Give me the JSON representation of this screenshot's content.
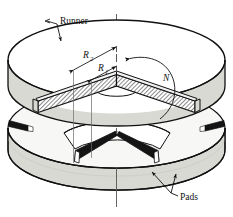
{
  "figure": {
    "type": "engineering-diagram",
    "labels": {
      "runner": "Runner",
      "pads": "Pads",
      "outer_radius": "R",
      "outer_radius_sub": "2",
      "inner_radius": "R",
      "inner_radius_sub": "1",
      "rotation": "N"
    },
    "colors": {
      "outline": "#111111",
      "rim_shade": "#d9d9d4",
      "top_face": "#ffffff",
      "pad_dark": "#1a1a1a",
      "hatch": "#333333",
      "background": "#ffffff"
    },
    "annotations": {
      "runner_leader": "leader line from Runner label to top disc edge",
      "pads_leader": "forked leader lines from Pads label to two pad wedges",
      "rotation_arrow": "curved arrow indicating runner rotation N",
      "centerline": "vertical dash-dot axis of rotation",
      "section_cut": "90 degree V wedge removed, cut faces cross-hatched"
    }
  }
}
